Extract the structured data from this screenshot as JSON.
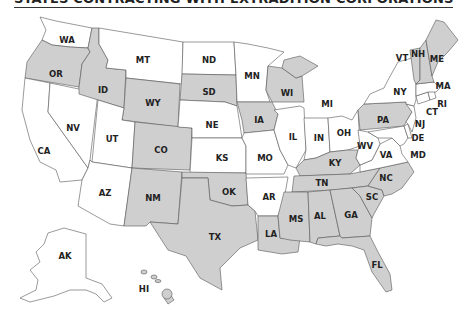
{
  "title": "STATES CONTRACTING WITH EXTRADITION CORPORATIONS",
  "colors": {
    "highlighted": "#cfcfcf",
    "default": "#ffffff",
    "border": "#555555",
    "label": "#222222"
  },
  "legend": {
    "highlighted_meaning": "State contracts with extradition corporations"
  },
  "states": {
    "WA": {
      "label": "WA",
      "highlighted": false
    },
    "OR": {
      "label": "OR",
      "highlighted": true
    },
    "CA": {
      "label": "CA",
      "highlighted": false
    },
    "ID": {
      "label": "ID",
      "highlighted": true
    },
    "NV": {
      "label": "NV",
      "highlighted": false
    },
    "MT": {
      "label": "MT",
      "highlighted": false
    },
    "WY": {
      "label": "WY",
      "highlighted": true
    },
    "UT": {
      "label": "UT",
      "highlighted": false
    },
    "AZ": {
      "label": "AZ",
      "highlighted": false
    },
    "CO": {
      "label": "CO",
      "highlighted": true
    },
    "NM": {
      "label": "NM",
      "highlighted": true
    },
    "ND": {
      "label": "ND",
      "highlighted": false
    },
    "SD": {
      "label": "SD",
      "highlighted": true
    },
    "NE": {
      "label": "NE",
      "highlighted": false
    },
    "KS": {
      "label": "KS",
      "highlighted": false
    },
    "OK": {
      "label": "OK",
      "highlighted": true
    },
    "TX": {
      "label": "TX",
      "highlighted": true
    },
    "MN": {
      "label": "MN",
      "highlighted": false
    },
    "IA": {
      "label": "IA",
      "highlighted": true
    },
    "MO": {
      "label": "MO",
      "highlighted": false
    },
    "AR": {
      "label": "AR",
      "highlighted": false
    },
    "LA": {
      "label": "LA",
      "highlighted": true
    },
    "WI": {
      "label": "WI",
      "highlighted": true
    },
    "IL": {
      "label": "IL",
      "highlighted": false
    },
    "MI": {
      "label": "MI",
      "highlighted": true
    },
    "IN": {
      "label": "IN",
      "highlighted": false
    },
    "OH": {
      "label": "OH",
      "highlighted": false
    },
    "KY": {
      "label": "KY",
      "highlighted": true
    },
    "TN": {
      "label": "TN",
      "highlighted": true
    },
    "MS": {
      "label": "MS",
      "highlighted": true
    },
    "AL": {
      "label": "AL",
      "highlighted": true
    },
    "GA": {
      "label": "GA",
      "highlighted": true
    },
    "FL": {
      "label": "FL",
      "highlighted": true
    },
    "SC": {
      "label": "SC",
      "highlighted": true
    },
    "NC": {
      "label": "NC",
      "highlighted": true
    },
    "VA": {
      "label": "VA",
      "highlighted": false
    },
    "WV": {
      "label": "WV",
      "highlighted": false
    },
    "MD": {
      "label": "MD",
      "highlighted": false
    },
    "DE": {
      "label": "DE",
      "highlighted": false
    },
    "PA": {
      "label": "PA",
      "highlighted": true
    },
    "NJ": {
      "label": "NJ",
      "highlighted": false
    },
    "NY": {
      "label": "NY",
      "highlighted": false
    },
    "CT": {
      "label": "CT",
      "highlighted": false
    },
    "RI": {
      "label": "RI",
      "highlighted": false
    },
    "MA": {
      "label": "MA",
      "highlighted": false
    },
    "VT": {
      "label": "VT",
      "highlighted": true
    },
    "NH": {
      "label": "NH",
      "highlighted": true
    },
    "ME": {
      "label": "ME",
      "highlighted": true
    },
    "AK": {
      "label": "AK",
      "highlighted": false
    },
    "HI": {
      "label": "HI",
      "highlighted": true
    }
  }
}
